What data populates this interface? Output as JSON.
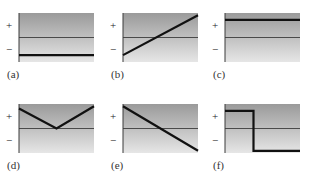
{
  "figure": {
    "axis_labels": {
      "plus": "+",
      "minus": "−"
    },
    "colors": {
      "gradient_top": "#9a9a9a",
      "gradient_bottom": "#e6e6e6",
      "axis": "#3a3a3a",
      "zero_line": "#4a4a4a",
      "curve": "#111111"
    },
    "panels": [
      {
        "label": "(a)",
        "shape": "constant negative",
        "points": [
          [
            0,
            -0.75
          ],
          [
            1,
            -0.75
          ]
        ]
      },
      {
        "label": "(b)",
        "shape": "increasing linear, negative to positive",
        "points": [
          [
            0,
            -0.75
          ],
          [
            1,
            0.95
          ]
        ]
      },
      {
        "label": "(c)",
        "shape": "constant positive",
        "points": [
          [
            0,
            0.75
          ],
          [
            1,
            0.75
          ]
        ]
      },
      {
        "label": "(d)",
        "shape": "V-shape touching zero at midpoint",
        "points": [
          [
            0,
            0.85
          ],
          [
            0.5,
            0.0
          ],
          [
            1,
            0.95
          ]
        ]
      },
      {
        "label": "(e)",
        "shape": "decreasing linear, positive to negative",
        "points": [
          [
            0,
            0.95
          ],
          [
            1,
            -0.95
          ]
        ]
      },
      {
        "label": "(f)",
        "shape": "step from positive to negative",
        "points": [
          [
            0,
            0.75
          ],
          [
            0.38,
            0.75
          ],
          [
            0.38,
            -0.95
          ],
          [
            1,
            -0.95
          ]
        ]
      }
    ]
  }
}
